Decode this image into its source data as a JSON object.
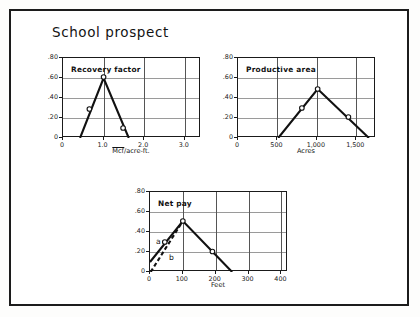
{
  "figure": {
    "title": "School prospect",
    "frame_color": "#1c1c1c",
    "background": "#ffffff",
    "line_color": "#111111",
    "grid_color": "#9a9a9a"
  },
  "chart_data": [
    {
      "id": "recovery-factor",
      "type": "line",
      "title": "Recovery factor",
      "xlabel": "Mcf/acre-ft.",
      "xlabel_overbar": "Mcf",
      "ylabel": "",
      "xlim": [
        0,
        3.4
      ],
      "ylim": [
        0,
        0.8
      ],
      "xticks": [
        0,
        1.0,
        2.0,
        3.0
      ],
      "xtick_labels": [
        "0",
        "1.0",
        "2.0",
        "3.0"
      ],
      "yticks": [
        0,
        0.2,
        0.4,
        0.6,
        0.8
      ],
      "ytick_labels": [
        "0",
        ".20",
        ".40",
        ".60",
        ".80"
      ],
      "grid": true,
      "series": [
        {
          "name": "recovery",
          "x": [
            0.42,
            1.0,
            1.62
          ],
          "y": [
            0.0,
            0.6,
            0.0
          ]
        }
      ],
      "markers": [
        {
          "x": 0.65,
          "y": 0.29
        },
        {
          "x": 1.0,
          "y": 0.61
        },
        {
          "x": 1.48,
          "y": 0.1
        }
      ]
    },
    {
      "id": "productive-area",
      "type": "line",
      "title": "Productive area",
      "xlabel": "Acres",
      "ylabel": "",
      "xlim": [
        0,
        1750
      ],
      "ylim": [
        0,
        0.8
      ],
      "xticks": [
        0,
        500,
        1000,
        1500
      ],
      "xtick_labels": [
        "0",
        "500",
        "1,000",
        "1,500"
      ],
      "yticks": [
        0,
        0.2,
        0.4,
        0.6,
        0.8
      ],
      "ytick_labels": [
        "0",
        ".20",
        ".40",
        ".60",
        ".80"
      ],
      "grid": true,
      "series": [
        {
          "name": "productive",
          "x": [
            510,
            1010,
            1660
          ],
          "y": [
            0.0,
            0.49,
            0.0
          ]
        }
      ],
      "markers": [
        {
          "x": 810,
          "y": 0.3
        },
        {
          "x": 1010,
          "y": 0.49
        },
        {
          "x": 1400,
          "y": 0.21
        }
      ]
    },
    {
      "id": "net-pay",
      "type": "line",
      "title": "Net pay",
      "xlabel": "Feet",
      "ylabel": "",
      "xlim": [
        0,
        420
      ],
      "ylim": [
        0,
        0.8
      ],
      "xticks": [
        0,
        100,
        200,
        300,
        400
      ],
      "xtick_labels": [
        "0",
        "100",
        "200",
        "300",
        "400"
      ],
      "yticks": [
        0,
        0.2,
        0.4,
        0.6,
        0.8
      ],
      "ytick_labels": [
        "0",
        ".20",
        ".40",
        ".60",
        ".80"
      ],
      "grid": true,
      "series": [
        {
          "name": "a",
          "style": "solid",
          "label": "a",
          "x": [
            0,
            100,
            250
          ],
          "y": [
            0.1,
            0.51,
            0.0
          ]
        },
        {
          "name": "b",
          "style": "dashed",
          "label": "b",
          "x": [
            2,
            100
          ],
          "y": [
            0.0,
            0.51
          ]
        }
      ],
      "markers": [
        {
          "x": 45,
          "y": 0.3
        },
        {
          "x": 100,
          "y": 0.51
        },
        {
          "x": 190,
          "y": 0.205
        }
      ],
      "series_labels": [
        {
          "text": "a",
          "x": 18,
          "y": 0.305
        },
        {
          "text": "b",
          "x": 58,
          "y": 0.145
        }
      ]
    }
  ]
}
